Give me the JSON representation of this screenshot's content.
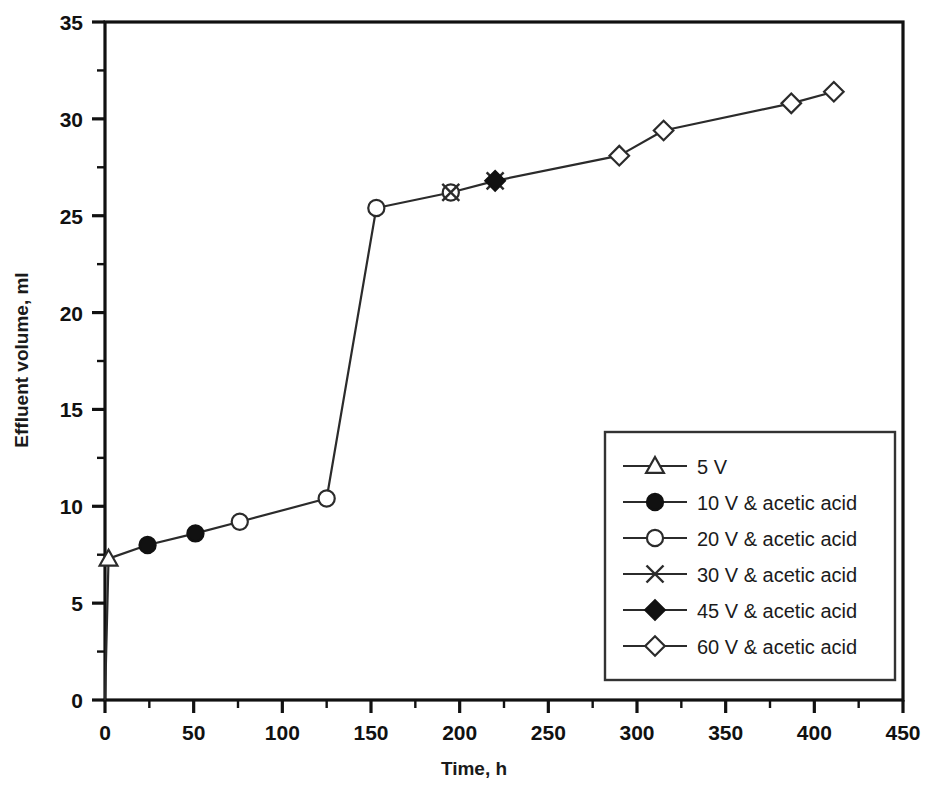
{
  "chart_data": {
    "type": "line",
    "title": "",
    "xlabel": "Time, h",
    "ylabel": "Effluent volume, ml",
    "xlim": [
      0,
      450
    ],
    "ylim": [
      0,
      35
    ],
    "x_major_step": 50,
    "x_minor_step": 25,
    "y_major_step": 5,
    "y_minor_step": 2.5,
    "x_ticks": [
      0,
      50,
      100,
      150,
      200,
      250,
      300,
      350,
      400,
      450
    ],
    "y_ticks": [
      0,
      5,
      10,
      15,
      20,
      25,
      30,
      35
    ],
    "grid": false,
    "legend_position": "inside-lower-right",
    "line_color": "#2b2b2b",
    "marker_fill_open": "#ffffff",
    "marker_fill_solid": "#111111",
    "axis_color": "#111111",
    "connector": {
      "comment_free": true,
      "x": [
        0,
        2,
        24,
        51,
        76,
        125,
        153,
        195,
        220,
        290,
        315,
        387,
        411
      ],
      "y": [
        0,
        7.3,
        8.0,
        8.6,
        9.2,
        10.4,
        25.4,
        26.2,
        26.8,
        28.1,
        29.4,
        30.8,
        31.4
      ]
    },
    "series": [
      {
        "name": "5 V",
        "marker": "triangle-open",
        "x": [
          2
        ],
        "y": [
          7.3
        ]
      },
      {
        "name": "10 V & acetic acid",
        "marker": "circle-filled",
        "x": [
          24,
          51
        ],
        "y": [
          8.0,
          8.6
        ]
      },
      {
        "name": "20 V & acetic acid",
        "marker": "circle-open",
        "x": [
          76,
          125,
          153,
          195
        ],
        "y": [
          9.2,
          10.4,
          25.4,
          26.2
        ]
      },
      {
        "name": "30 V & acetic acid",
        "marker": "x-cross",
        "x": [
          195,
          220
        ],
        "y": [
          26.2,
          26.8
        ]
      },
      {
        "name": "45 V & acetic acid",
        "marker": "diamond-filled",
        "x": [
          220
        ],
        "y": [
          26.8
        ]
      },
      {
        "name": "60 V & acetic acid",
        "marker": "diamond-open",
        "x": [
          290,
          315,
          387,
          411
        ],
        "y": [
          28.1,
          29.4,
          30.8,
          31.4
        ]
      }
    ]
  },
  "legend": {
    "entries": [
      {
        "label": "5 V",
        "marker": "triangle-open"
      },
      {
        "label": "10 V & acetic acid",
        "marker": "circle-filled"
      },
      {
        "label": "20 V & acetic acid",
        "marker": "circle-open"
      },
      {
        "label": "30 V & acetic acid",
        "marker": "x-cross"
      },
      {
        "label": "45 V & acetic acid",
        "marker": "diamond-filled"
      },
      {
        "label": "60 V & acetic acid",
        "marker": "diamond-open"
      }
    ]
  },
  "axes": {
    "x_tick_labels": [
      "0",
      "50",
      "100",
      "150",
      "200",
      "250",
      "300",
      "350",
      "400",
      "450"
    ],
    "y_tick_labels": [
      "0",
      "5",
      "10",
      "15",
      "20",
      "25",
      "30",
      "35"
    ],
    "x_title": "Time, h",
    "y_title": "Effluent volume, ml"
  }
}
